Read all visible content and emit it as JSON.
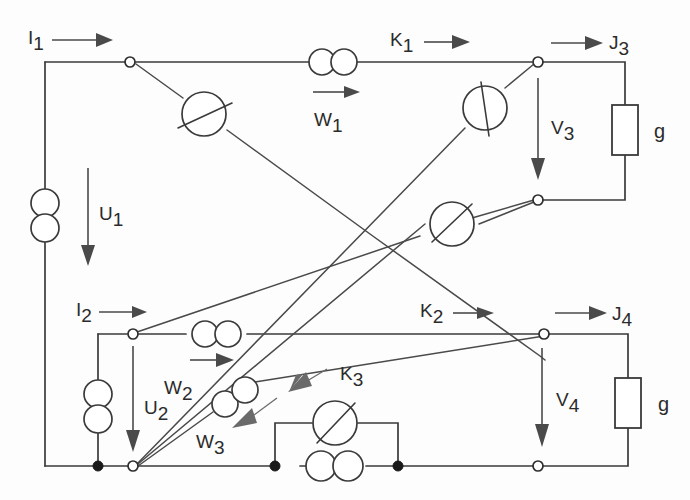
{
  "figure": {
    "type": "electrical-circuit-schematic",
    "title": "",
    "background_color": "#fdfdfd",
    "line_color": "#3a3a3a",
    "label_color": "#2b2b2b"
  },
  "labels": {
    "i1": {
      "base": "I",
      "sub": "1"
    },
    "i2": {
      "base": "I",
      "sub": "2"
    },
    "u1": {
      "base": "U",
      "sub": "1"
    },
    "u2": {
      "base": "U",
      "sub": "2"
    },
    "w1": {
      "base": "W",
      "sub": "1"
    },
    "w2": {
      "base": "W",
      "sub": "2"
    },
    "w3": {
      "base": "W",
      "sub": "3"
    },
    "k1": {
      "base": "K",
      "sub": "1"
    },
    "k2": {
      "base": "K",
      "sub": "2"
    },
    "k3": {
      "base": "K",
      "sub": "3"
    },
    "j3": {
      "base": "J",
      "sub": "3"
    },
    "j4": {
      "base": "J",
      "sub": "4"
    },
    "v3": {
      "base": "V",
      "sub": "3"
    },
    "v4": {
      "base": "V",
      "sub": "4"
    },
    "g_top": "g",
    "g_bottom": "g"
  },
  "components": {
    "sources": [
      {
        "name": "U1",
        "symbol": "double-circle-vertical",
        "label": "U1",
        "direction": "down"
      },
      {
        "name": "U2",
        "symbol": "double-circle-vertical",
        "label": "U2",
        "direction": "down"
      }
    ],
    "couplers": [
      {
        "name": "W1",
        "symbol": "double-circle-horizontal",
        "orientation": "horizontal",
        "arrow": "right"
      },
      {
        "name": "W2",
        "symbol": "double-circle-horizontal",
        "orientation": "horizontal",
        "arrow": "right"
      },
      {
        "name": "W3",
        "symbol": "double-circle-diagonal",
        "orientation": "diagonal",
        "arrow": "down-left"
      },
      {
        "name": "W4",
        "symbol": "double-circle-horizontal",
        "orientation": "horizontal",
        "arrow": "none"
      }
    ],
    "meters": [
      {
        "name": "M1",
        "symbol": "circle-with-slash",
        "branch": "top-left-diagonal"
      },
      {
        "name": "M2",
        "symbol": "circle-with-slash",
        "branch": "upper-right-diagonal"
      },
      {
        "name": "M3",
        "symbol": "circle-with-slash",
        "branch": "mid-right-diagonal"
      },
      {
        "name": "M4",
        "symbol": "circle-with-slash",
        "branch": "bottom-parallel"
      }
    ],
    "resistors": [
      {
        "name": "g-top",
        "label": "g",
        "orientation": "vertical"
      },
      {
        "name": "g-bottom",
        "label": "g",
        "orientation": "vertical"
      }
    ],
    "nodes_open": 6,
    "nodes_filled": 3
  },
  "currents": [
    {
      "label": "I1",
      "direction": "right",
      "location": "top-left-input"
    },
    {
      "label": "I2",
      "direction": "right",
      "location": "mid-left-input"
    },
    {
      "label": "K1",
      "direction": "right",
      "location": "top-rail"
    },
    {
      "label": "K2",
      "direction": "right",
      "location": "mid-rail"
    },
    {
      "label": "K3",
      "direction": "up-left",
      "location": "lower-diagonal"
    },
    {
      "label": "J3",
      "direction": "right",
      "location": "top-right-output"
    },
    {
      "label": "J4",
      "direction": "right",
      "location": "mid-right-output"
    }
  ],
  "voltages": [
    {
      "label": "U1",
      "direction": "down",
      "location": "left-port-1"
    },
    {
      "label": "U2",
      "direction": "down",
      "location": "left-port-2"
    },
    {
      "label": "V3",
      "direction": "down",
      "location": "right-port-3"
    },
    {
      "label": "V4",
      "direction": "down",
      "location": "right-port-4"
    }
  ]
}
